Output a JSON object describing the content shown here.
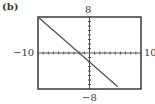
{
  "panel_label": "(b)",
  "window": {
    "ymax_label": "8",
    "ymin_label": "−8",
    "xmin_label": "−10",
    "xmax_label": "10"
  },
  "colors": {
    "frame": "#3a3a3a",
    "axis": "#555555",
    "line": "#555555",
    "background": "#ffffff"
  },
  "chart_data": {
    "type": "line",
    "title": "(b)",
    "xlabel": "",
    "ylabel": "",
    "xlim": [
      -10,
      10
    ],
    "ylim": [
      -8,
      8
    ],
    "xticks_step": 1,
    "yticks_step": 1,
    "grid": false,
    "legend": null,
    "series": [
      {
        "name": "y = -x - 2",
        "x": [
          -10,
          -5,
          0,
          5.5
        ],
        "y": [
          8,
          3,
          -2,
          -7.5
        ]
      }
    ]
  }
}
